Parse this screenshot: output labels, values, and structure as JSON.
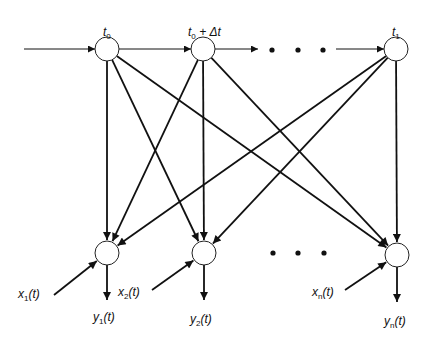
{
  "diagram": {
    "title": "",
    "colors": {
      "line": "#111111",
      "node_fill": "#ffffff",
      "background": "#ffffff"
    },
    "node_radius": 12,
    "top_nodes": [
      {
        "id": "t0",
        "label_main": "t",
        "label_sub": "0",
        "label_suffix": "",
        "x": 107,
        "y": 49
      },
      {
        "id": "t0dt",
        "label_main": "t",
        "label_sub": "0",
        "label_suffix": " +  Δt",
        "x": 203,
        "y": 49
      },
      {
        "id": "t1",
        "label_main": "t",
        "label_sub": "1",
        "label_suffix": "",
        "x": 396,
        "y": 49
      }
    ],
    "bottom_nodes": [
      {
        "id": "n1",
        "x": 107,
        "y": 253,
        "input": {
          "main": "x",
          "sub": "1",
          "arg": "(t)"
        },
        "output": {
          "main": "y",
          "sub": "1",
          "arg": "(t)"
        }
      },
      {
        "id": "n2",
        "x": 204,
        "y": 253,
        "input": {
          "main": "x",
          "sub": "2",
          "arg": "(t)"
        },
        "output": {
          "main": "y",
          "sub": "2",
          "arg": "(t)"
        }
      },
      {
        "id": "nn",
        "x": 397,
        "y": 255,
        "input": {
          "main": "x",
          "sub": "n",
          "arg": "(t)"
        },
        "output": {
          "main": "y",
          "sub": "n",
          "arg": "(t)"
        }
      }
    ],
    "ellipsis_top": [
      [
        272,
        50
      ],
      [
        298,
        50
      ],
      [
        323,
        50
      ]
    ],
    "ellipsis_bottom": [
      [
        273,
        253
      ],
      [
        298,
        253
      ],
      [
        324,
        253
      ]
    ],
    "chain_arrows": [
      {
        "from": [
          24,
          49
        ],
        "to": [
          95,
          49
        ],
        "weight": "thin"
      },
      {
        "from": [
          119,
          49
        ],
        "to": [
          191,
          49
        ],
        "weight": "thin"
      },
      {
        "from": [
          215,
          49
        ],
        "to": [
          258,
          49
        ],
        "weight": "thin"
      },
      {
        "from": [
          336,
          49
        ],
        "to": [
          384,
          49
        ],
        "weight": "thin"
      }
    ],
    "cross_edges": [
      {
        "from": "t0",
        "to": "n1"
      },
      {
        "from": "t0",
        "to": "n2"
      },
      {
        "from": "t0",
        "to": "nn"
      },
      {
        "from": "t0dt",
        "to": "n1"
      },
      {
        "from": "t0dt",
        "to": "n2"
      },
      {
        "from": "t0dt",
        "to": "nn"
      },
      {
        "from": "t1",
        "to": "n1"
      },
      {
        "from": "t1",
        "to": "n2"
      },
      {
        "from": "t1",
        "to": "nn"
      }
    ],
    "input_arrows": [
      {
        "from": [
          54,
          295
        ],
        "to": "n1"
      },
      {
        "from": [
          152,
          290
        ],
        "to": "n2"
      },
      {
        "from": [
          345,
          290
        ],
        "to": "nn"
      }
    ],
    "output_arrows": [
      {
        "from": "n1",
        "to": [
          107,
          300
        ]
      },
      {
        "from": "n2",
        "to": [
          204,
          300
        ]
      },
      {
        "from": "nn",
        "to": [
          397,
          302
        ]
      }
    ],
    "labels": {
      "top": [
        {
          "x": 103,
          "y": 26
        },
        {
          "x": 188,
          "y": 26
        },
        {
          "x": 392,
          "y": 26
        }
      ],
      "inputs": [
        {
          "x": 18,
          "y": 288
        },
        {
          "x": 118,
          "y": 286
        },
        {
          "x": 312,
          "y": 286
        }
      ],
      "outputs": [
        {
          "x": 93,
          "y": 311
        },
        {
          "x": 190,
          "y": 313
        },
        {
          "x": 384,
          "y": 315
        }
      ]
    }
  }
}
